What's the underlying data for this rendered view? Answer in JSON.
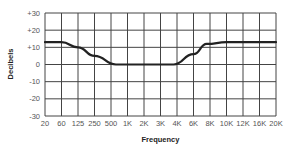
{
  "chart_data": {
    "type": "line",
    "title": "",
    "xlabel": "Frequency",
    "ylabel": "Decibels",
    "x_ticks": [
      "20",
      "60",
      "125",
      "250",
      "500",
      "1K",
      "2K",
      "3K",
      "4K",
      "6K",
      "8K",
      "10K",
      "12K",
      "16K",
      "20K"
    ],
    "y_ticks": [
      "+30",
      "+20",
      "+10",
      "0",
      "-10",
      "-20",
      "-30"
    ],
    "ylim": [
      -30,
      30
    ],
    "grid": true,
    "legend": null,
    "series": [
      {
        "name": "EQ curve",
        "color": "#222222",
        "points": [
          {
            "x": "20",
            "y": 13
          },
          {
            "x": "60",
            "y": 13
          },
          {
            "x": "125",
            "y": 10
          },
          {
            "x": "250",
            "y": 5
          },
          {
            "x": "500",
            "y": 0
          },
          {
            "x": "1K",
            "y": 0
          },
          {
            "x": "2K",
            "y": 0
          },
          {
            "x": "3K",
            "y": 0
          },
          {
            "x": "4K",
            "y": 0
          },
          {
            "x": "6K",
            "y": 6
          },
          {
            "x": "8K",
            "y": 12
          },
          {
            "x": "10K",
            "y": 13
          },
          {
            "x": "12K",
            "y": 13
          },
          {
            "x": "16K",
            "y": 13
          },
          {
            "x": "20K",
            "y": 13
          }
        ],
        "x_index": [
          0,
          1,
          2,
          3,
          4.3,
          5,
          6,
          7,
          7.8,
          9,
          9.8,
          11,
          12,
          13,
          14
        ]
      }
    ]
  }
}
